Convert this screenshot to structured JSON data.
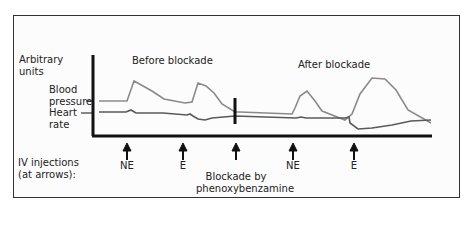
{
  "figure": {
    "y_axis_label": [
      "Arbitrary",
      "units"
    ],
    "titles": {
      "before": "Before blockade",
      "after": "After blockade"
    },
    "trace_labels": {
      "blood_pressure": [
        "Blood",
        "pressure"
      ],
      "heart_rate": [
        "Heart",
        "rate"
      ]
    },
    "injections_label": [
      "IV injections",
      "(at arrows):"
    ],
    "arrows": [
      {
        "label": "NE"
      },
      {
        "label": "E"
      },
      {
        "label": "Blockade by phenoxybenzamine",
        "lines": [
          "Blockade by",
          "phenoxybenzamine"
        ]
      },
      {
        "label": "NE"
      },
      {
        "label": "E"
      }
    ],
    "colors": {
      "blood_pressure": "#8a8a8a",
      "heart_rate": "#5a5a5a",
      "axes": "#111111"
    }
  }
}
